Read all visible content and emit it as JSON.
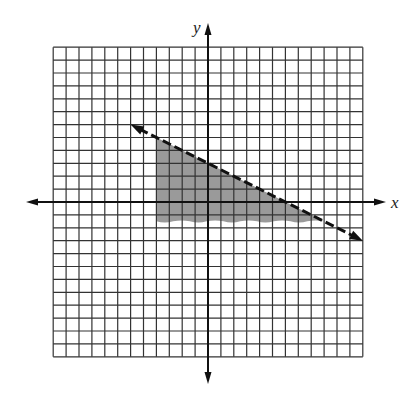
{
  "chart_data": {
    "type": "inequality-graph",
    "title": "",
    "xlabel": "x",
    "ylabel": "y",
    "grid": true,
    "xlim": [
      -12,
      12
    ],
    "ylim": [
      -12,
      12
    ],
    "grid_step": 1,
    "tick_labels": [],
    "boundary_line": {
      "equation": "y = -1/2 x + 3",
      "slope": -0.5,
      "y_intercept": 3,
      "x_intercept": 6,
      "style": "dashed",
      "arrow_endpoints": [
        [
          -6,
          6
        ],
        [
          12,
          -3
        ]
      ]
    },
    "shaded_region": {
      "description": "Region below the dashed line, to the right of x = -4, above approximately y = -1.5",
      "vertices": [
        [
          -4,
          5
        ],
        [
          -4,
          -1.5
        ],
        [
          9,
          -1.5
        ]
      ],
      "color": "#9a9a9a"
    },
    "colors": {
      "grid": "#333333",
      "axes": "#111111",
      "line": "#111111",
      "shade": "#9a9a9a"
    }
  },
  "labels": {
    "x_axis": "x",
    "y_axis": "y"
  }
}
